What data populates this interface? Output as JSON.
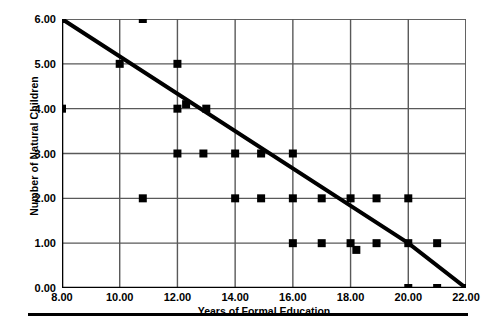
{
  "chart_data": {
    "type": "scatter",
    "title": "",
    "xlabel": "Years of Formal Education",
    "ylabel": "Number of Natural Children",
    "xlim": [
      8,
      22
    ],
    "ylim": [
      0,
      6
    ],
    "xticks": [
      "8.00",
      "10.00",
      "12.00",
      "14.00",
      "16.00",
      "18.00",
      "20.00",
      "22.00"
    ],
    "xtick_values": [
      8,
      10,
      12,
      14,
      16,
      18,
      20,
      22
    ],
    "yticks": [
      "0.00",
      "1.00",
      "2.00",
      "3.00",
      "4.00",
      "5.00",
      "6.00"
    ],
    "ytick_values": [
      0,
      1,
      2,
      3,
      4,
      5,
      6
    ],
    "grid": true,
    "legend": "none",
    "marker": "filled-square",
    "marker_color": "#000000",
    "points": [
      {
        "x": 8.0,
        "y": 6
      },
      {
        "x": 10.8,
        "y": 6
      },
      {
        "x": 10.0,
        "y": 5
      },
      {
        "x": 12.0,
        "y": 5
      },
      {
        "x": 8.0,
        "y": 4
      },
      {
        "x": 12.0,
        "y": 4
      },
      {
        "x": 12.3,
        "y": 4.1
      },
      {
        "x": 13.0,
        "y": 4
      },
      {
        "x": 12.0,
        "y": 3
      },
      {
        "x": 12.9,
        "y": 3
      },
      {
        "x": 14.0,
        "y": 3
      },
      {
        "x": 14.9,
        "y": 3
      },
      {
        "x": 16.0,
        "y": 3
      },
      {
        "x": 10.8,
        "y": 2
      },
      {
        "x": 14.0,
        "y": 2
      },
      {
        "x": 14.9,
        "y": 2
      },
      {
        "x": 16.0,
        "y": 2
      },
      {
        "x": 17.0,
        "y": 2
      },
      {
        "x": 18.0,
        "y": 2
      },
      {
        "x": 18.9,
        "y": 2
      },
      {
        "x": 20.0,
        "y": 2
      },
      {
        "x": 16.0,
        "y": 1
      },
      {
        "x": 17.0,
        "y": 1
      },
      {
        "x": 18.0,
        "y": 1
      },
      {
        "x": 18.2,
        "y": 0.85
      },
      {
        "x": 18.9,
        "y": 1
      },
      {
        "x": 20.0,
        "y": 1
      },
      {
        "x": 21.0,
        "y": 1
      },
      {
        "x": 20.0,
        "y": 0
      },
      {
        "x": 21.0,
        "y": 0
      },
      {
        "x": 22.0,
        "y": 0
      }
    ],
    "trend_line": {
      "name": "fit-line",
      "color": "#000000",
      "width": 4,
      "points": [
        {
          "x": 8,
          "y": 6
        },
        {
          "x": 20,
          "y": 1
        },
        {
          "x": 22,
          "y": 0
        }
      ]
    }
  },
  "figure": {
    "caption": ""
  }
}
